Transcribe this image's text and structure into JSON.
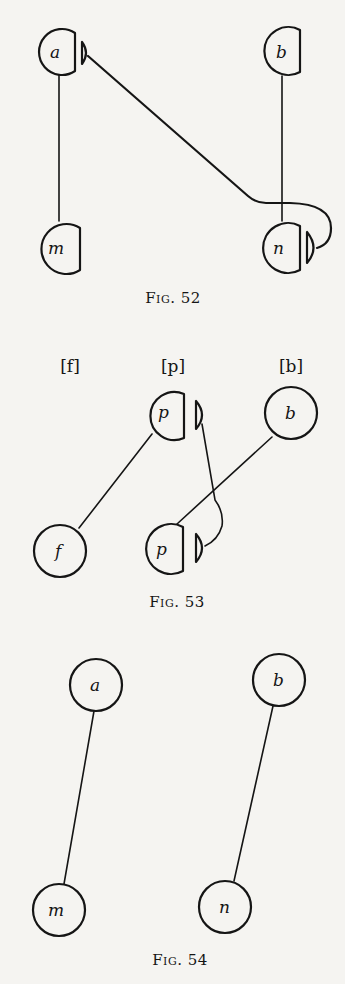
{
  "figures": [
    {
      "caption": "Fig. 52",
      "nodes": [
        {
          "id": "a",
          "label": "a"
        },
        {
          "id": "b",
          "label": "b"
        },
        {
          "id": "m",
          "label": "m"
        },
        {
          "id": "n",
          "label": "n"
        }
      ]
    },
    {
      "caption": "Fig. 53",
      "column_labels": [
        "[f]",
        "[p]",
        "[b]"
      ],
      "nodes": [
        {
          "id": "p-top",
          "label": "p"
        },
        {
          "id": "b",
          "label": "b"
        },
        {
          "id": "f",
          "label": "f"
        },
        {
          "id": "p-bottom",
          "label": "p"
        }
      ]
    },
    {
      "caption": "Fig. 54",
      "nodes": [
        {
          "id": "a",
          "label": "a"
        },
        {
          "id": "b",
          "label": "b"
        },
        {
          "id": "m",
          "label": "m"
        },
        {
          "id": "n",
          "label": "n"
        }
      ]
    }
  ],
  "colors": {
    "ink": "#151515",
    "paper": "#f5f4f1"
  }
}
